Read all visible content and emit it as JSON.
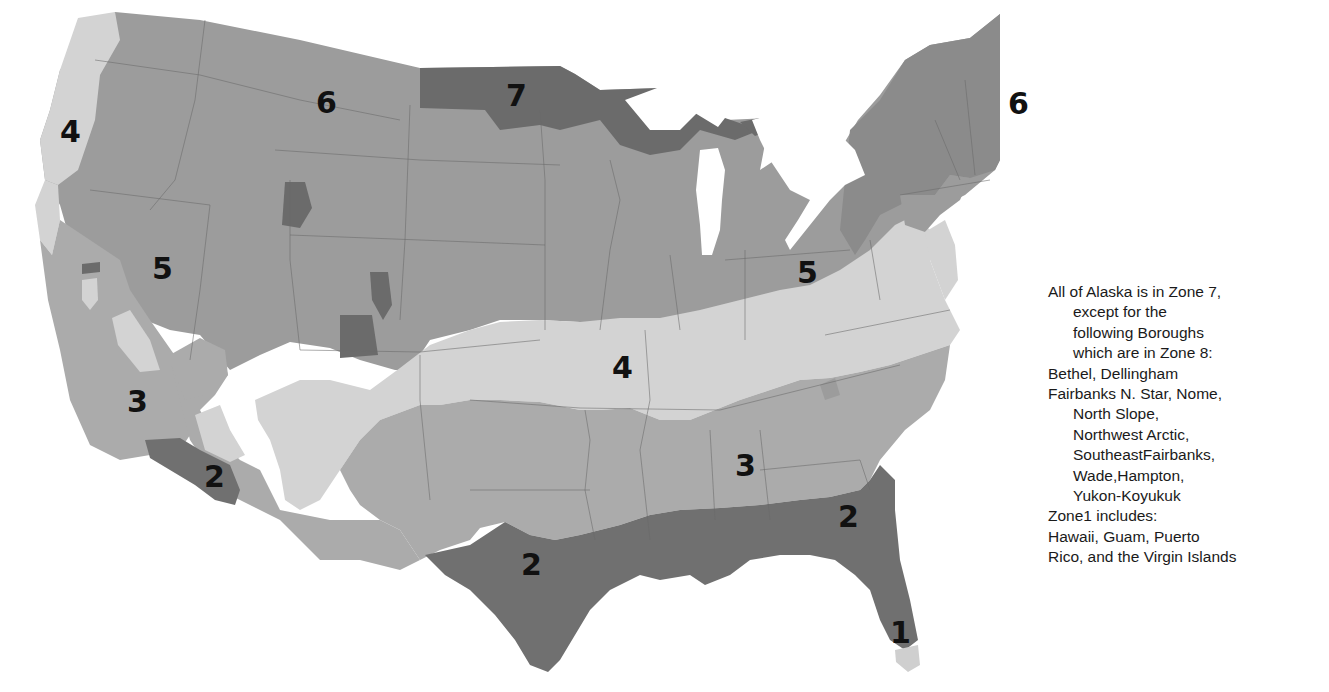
{
  "map": {
    "title": "U.S. Climate Zone Map",
    "colors": {
      "zone1": "#cdcdcd",
      "zone2": "#6f6f6f",
      "zone3": "#ababab",
      "zone4": "#d3d3d3",
      "zone5": "#9b9b9b",
      "zone6": "#9e9e9e",
      "zone7": "#6a6a6a",
      "background": "#ffffff"
    },
    "labels": [
      {
        "id": "zone-4-west",
        "text": "4",
        "x": 72,
        "y": 142
      },
      {
        "id": "zone-6-northwest",
        "text": "6",
        "x": 326,
        "y": 113
      },
      {
        "id": "zone-7-north",
        "text": "7",
        "x": 516,
        "y": 106
      },
      {
        "id": "zone-6-northeast",
        "text": "6",
        "x": 1018,
        "y": 110
      },
      {
        "id": "zone-5-west",
        "text": "5",
        "x": 162,
        "y": 279
      },
      {
        "id": "zone-5-east",
        "text": "5",
        "x": 807,
        "y": 283
      },
      {
        "id": "zone-4-central",
        "text": "4",
        "x": 622,
        "y": 378
      },
      {
        "id": "zone-3-west",
        "text": "3",
        "x": 137,
        "y": 412
      },
      {
        "id": "zone-3-southeast",
        "text": "3",
        "x": 745,
        "y": 476
      },
      {
        "id": "zone-2-southwest",
        "text": "2",
        "x": 214,
        "y": 487
      },
      {
        "id": "zone-2-texas",
        "text": "2",
        "x": 531,
        "y": 575
      },
      {
        "id": "zone-2-florida",
        "text": "2",
        "x": 848,
        "y": 527
      },
      {
        "id": "zone-1-florida",
        "text": "1",
        "x": 900,
        "y": 643
      }
    ]
  },
  "note": {
    "lines": [
      {
        "text": "All of Alaska is in Zone 7,",
        "indent": false
      },
      {
        "text": "except for the",
        "indent": true
      },
      {
        "text": "following Boroughs",
        "indent": true
      },
      {
        "text": "which are in Zone 8:",
        "indent": true
      },
      {
        "text": "Bethel, Dellingham",
        "indent": false
      },
      {
        "text": "Fairbanks N. Star, Nome,",
        "indent": false
      },
      {
        "text": "North Slope,",
        "indent": true
      },
      {
        "text": "Northwest Arctic,",
        "indent": true
      },
      {
        "text": "SoutheastFairbanks,",
        "indent": true
      },
      {
        "text": "Wade,Hampton,",
        "indent": true
      },
      {
        "text": "Yukon-Koyukuk",
        "indent": true
      },
      {
        "text": "Zone1 includes:",
        "indent": false
      },
      {
        "text": "Hawaii, Guam, Puerto",
        "indent": false
      },
      {
        "text": "Rico, and the Virgin Islands",
        "indent": false
      }
    ]
  }
}
